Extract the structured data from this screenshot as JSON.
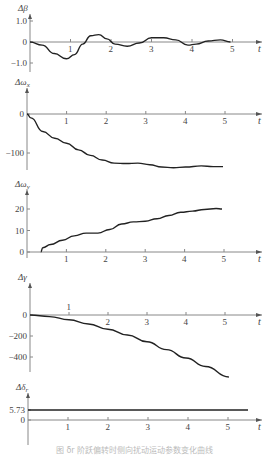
{
  "chart_data": [
    {
      "type": "line",
      "title": "",
      "ylabel": "Δβ",
      "xlabel": "t",
      "xticks": [
        1,
        2,
        3,
        4,
        5
      ],
      "yticks": [
        {
          "v": 1.0,
          "label": "1.0"
        },
        {
          "v": 0,
          "label": "0"
        },
        {
          "v": -1.0,
          "label": "−1.0"
        }
      ],
      "ylim": [
        -1.2,
        1.4
      ],
      "x": [
        0,
        0.3,
        0.6,
        0.9,
        1.1,
        1.3,
        1.5,
        1.7,
        1.9,
        2.1,
        2.4,
        2.7,
        3.0,
        3.3,
        3.6,
        3.9,
        4.1,
        4.4,
        4.7,
        4.95
      ],
      "values": [
        0,
        -0.15,
        -0.55,
        -0.8,
        -0.6,
        -0.1,
        0.3,
        0.35,
        0.15,
        -0.1,
        -0.2,
        -0.05,
        0.2,
        0.2,
        0.1,
        -0.15,
        -0.1,
        0.05,
        0.1,
        0.0
      ],
      "layout": {
        "ox": 30,
        "oy": 42,
        "xscale": 40.5,
        "yscale": 21,
        "yTop": 14,
        "yBottom": 72,
        "xEnd": 262
      }
    },
    {
      "type": "line",
      "ylabel": "Δω_x",
      "xlabel": "t",
      "xticks": [
        1,
        2,
        3,
        4,
        5
      ],
      "yticks": [
        {
          "v": 0,
          "label": "0"
        },
        {
          "v": -100,
          "label": "−100"
        }
      ],
      "ylim": [
        -140,
        30
      ],
      "x": [
        0,
        0.1,
        0.4,
        0.7,
        1.0,
        1.3,
        1.6,
        1.9,
        2.2,
        2.5,
        2.8,
        3.1,
        3.4,
        3.7,
        4.0,
        4.4,
        4.7,
        4.95
      ],
      "values": [
        0,
        -10,
        -45,
        -62,
        -75,
        -92,
        -106,
        -118,
        -126,
        -127,
        -126,
        -130,
        -136,
        -138,
        -136,
        -133,
        -135,
        -135
      ],
      "layout": {
        "ox": 27,
        "oy": 114,
        "xscale": 39.6,
        "yscale": 0.39,
        "yTop": 88,
        "yBottom": 170,
        "xEnd": 262
      }
    },
    {
      "type": "line",
      "ylabel": "Δω_y",
      "xlabel": "t",
      "xticks": [
        1,
        2,
        3,
        4,
        5
      ],
      "yticks": [
        {
          "v": 20,
          "label": "20"
        },
        {
          "v": 10,
          "label": "10"
        },
        {
          "v": 0,
          "label": "0"
        }
      ],
      "ylim": [
        0,
        26
      ],
      "x": [
        0.35,
        0.4,
        0.6,
        0.9,
        1.2,
        1.5,
        1.8,
        2.1,
        2.4,
        2.7,
        3.0,
        3.3,
        3.6,
        3.9,
        4.2,
        4.5,
        4.8,
        4.95
      ],
      "values": [
        0,
        2,
        3.5,
        5.5,
        7.5,
        8.8,
        8.8,
        10.5,
        13,
        14,
        14.3,
        15.5,
        17,
        18.5,
        19,
        19.8,
        20.2,
        20
      ],
      "layout": {
        "ox": 27,
        "oy": 252,
        "xscale": 39.4,
        "yscale": 2.15,
        "yTop": 190,
        "yBottom": 258,
        "xEnd": 262
      }
    },
    {
      "type": "line",
      "ylabel": "Δγ",
      "xlabel": "t",
      "xticks": [
        1,
        2,
        3,
        4,
        5
      ],
      "yticks": [
        {
          "v": 0,
          "label": "0"
        },
        {
          "v": -200,
          "label": "−200"
        },
        {
          "v": -400,
          "label": "−400"
        }
      ],
      "ylim": [
        -600,
        100
      ],
      "x": [
        0,
        0.5,
        1.0,
        1.5,
        2.0,
        2.5,
        3.0,
        3.5,
        4.0,
        4.5,
        5.1
      ],
      "values": [
        0,
        -15,
        -45,
        -85,
        -135,
        -190,
        -255,
        -330,
        -410,
        -490,
        -590
      ],
      "layout": {
        "ox": 30,
        "oy": 315,
        "xscale": 39,
        "yscale": 0.105,
        "yTop": 283,
        "yBottom": 372,
        "xEnd": 262,
        "xTickAbove": [
          1
        ]
      }
    },
    {
      "type": "line",
      "ylabel": "Δδ_r",
      "xlabel": "t",
      "xticks": [
        1,
        2,
        3,
        4,
        5
      ],
      "yticks": [
        {
          "v": 5.73,
          "label": "5.73"
        },
        {
          "v": 0,
          "label": "0"
        }
      ],
      "ylim": [
        -5,
        10
      ],
      "x": [
        0,
        5.5
      ],
      "values": [
        5.73,
        5.73
      ],
      "layout": {
        "ox": 28,
        "oy": 420,
        "xscale": 40,
        "yscale": 1.75,
        "yTop": 393,
        "yBottom": 445,
        "xEnd": 262
      }
    }
  ],
  "caption": "图 δr 阶跃偏转时侧向扰动运动参数变化曲线"
}
